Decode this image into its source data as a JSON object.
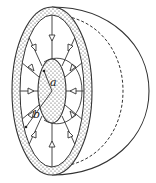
{
  "diagram": {
    "title": "",
    "labels": {
      "inner_radius": "a",
      "outer_radius": "b"
    },
    "colors": {
      "stroke": "#333333",
      "dots": "#444444",
      "background": "#ffffff"
    },
    "field_direction": "inward",
    "field_line_count": 12
  }
}
